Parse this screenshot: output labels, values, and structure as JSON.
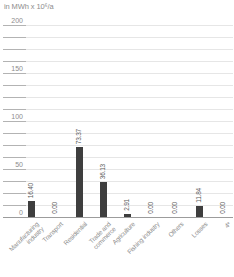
{
  "chart_data": {
    "type": "bar",
    "title": "in MWh x 10⁶/a",
    "ylabel": "in MWh x 10⁶/a",
    "xlabel": "",
    "categories": [
      "Manufacturing\nindustry",
      "Transport",
      "Residential",
      "Trade and\ncommerce",
      "Agriculture",
      "Fishing industry",
      "Others",
      "Losses",
      "4*"
    ],
    "values": [
      16.4,
      0.0,
      73.37,
      36.13,
      2.91,
      0.0,
      0.0,
      11.84,
      0.0
    ],
    "value_labels": [
      "16.40",
      "0.00",
      "73.37",
      "36.13",
      "2.91",
      "0.00",
      "0.00",
      "11.84",
      "0.00"
    ],
    "ylim": [
      0,
      200
    ],
    "y_major_ticks": [
      0,
      50,
      100,
      150,
      200
    ],
    "y_tick_labels": [
      "0",
      "50",
      "100",
      "150",
      "200"
    ],
    "y_minor_step": 12.5,
    "grid": "horizontal-minor-and-major",
    "legend": "none",
    "colors": {
      "bar": "#3e3e3e",
      "grid_plot": "#e6e6e6",
      "grid_tick": "#b3b3b3",
      "axis": "#9c9c9c",
      "label_text": "#8d8d8d",
      "value_text": "#5a5a5a",
      "background": "#ffffff"
    }
  }
}
